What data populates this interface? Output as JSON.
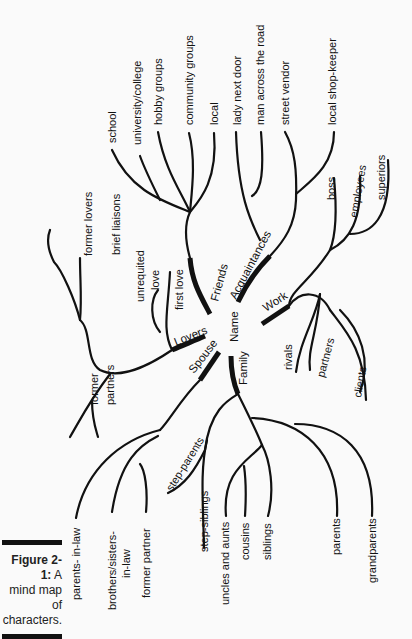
{
  "caption": {
    "figure_label": "Figure 2-1:",
    "text_line1": "A",
    "text_line2": "mind map of",
    "text_line3": "characters."
  },
  "diagram": {
    "center": "Name",
    "main_branches": {
      "friends": "Friends",
      "acquaintances": "Acquaintances",
      "work": "Work",
      "lovers": "Lovers",
      "spouse": "Spouse",
      "family": "Family"
    },
    "friends_children": [
      "school",
      "university/college",
      "hobby groups",
      "community groups",
      "local"
    ],
    "acquaintances_children": [
      "lady next door",
      "man across the road",
      "street vendor",
      "local shop-keeper"
    ],
    "work_children": [
      "boss",
      "employees",
      "superiors",
      "rivals",
      "partners",
      "clients"
    ],
    "lovers_children": [
      "former lovers",
      "brief liaisons",
      "unrequited love",
      "first love",
      "former partners"
    ],
    "lovers_labels": {
      "unrequited": "unrequited",
      "love": "love",
      "first_love": "first love",
      "former": "former",
      "partners": "partners"
    },
    "spouse_children": [
      "parents- in-law",
      "brothers/sisters- in-law",
      "former partner",
      "step-parents",
      "step-siblings"
    ],
    "spouse_labels": {
      "brothers_line1": "brothers/sisters-",
      "brothers_line2": "in-law"
    },
    "family_children": [
      "uncles and aunts",
      "cousins",
      "siblings",
      "parents",
      "grandparents"
    ]
  }
}
